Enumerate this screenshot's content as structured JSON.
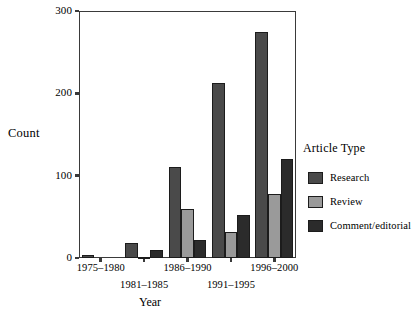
{
  "chart_data": {
    "type": "bar",
    "title": "",
    "xlabel": "Year",
    "ylabel": "Count",
    "ylim": [
      0,
      300
    ],
    "yticks": [
      0,
      100,
      200,
      300
    ],
    "grid": false,
    "legend_position": "right",
    "legend_title": "Article Type",
    "categories": [
      "1975–1980",
      "1981–1985",
      "1986–1990",
      "1991–1995",
      "1996–2000"
    ],
    "series": [
      {
        "name": "Research",
        "color": "#4a4a4a",
        "values": [
          4,
          18,
          110,
          213,
          275
        ]
      },
      {
        "name": "Review",
        "color": "#9a9a9a",
        "values": [
          0,
          1,
          59,
          32,
          78
        ]
      },
      {
        "name": "Comment/editorial",
        "color": "#2b2b2b",
        "values": [
          0,
          10,
          22,
          52,
          120
        ]
      }
    ]
  },
  "axis": {
    "y_title": "Count",
    "x_title": "Year",
    "y_tick_labels": [
      "0",
      "100",
      "200",
      "300"
    ],
    "x_tick_labels": [
      "1975–1980",
      "1981–1985",
      "1986–1990",
      "1991–1995",
      "1996–2000"
    ]
  },
  "legend": {
    "title": "Article Type",
    "items": [
      {
        "label": "Research",
        "color": "#4a4a4a"
      },
      {
        "label": "Review",
        "color": "#9a9a9a"
      },
      {
        "label": "Comment/editorial",
        "color": "#2b2b2b"
      }
    ]
  }
}
